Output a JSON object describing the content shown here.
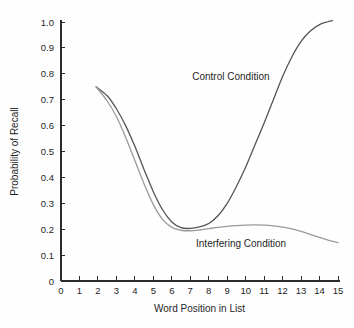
{
  "chart_data": {
    "type": "line",
    "title": "",
    "xlabel": "Word Position in List",
    "ylabel": "Probability of Recall",
    "xlim": [
      0,
      15
    ],
    "ylim": [
      0,
      1.0
    ],
    "grid": false,
    "legend_position": "inline-annotation",
    "x_ticks": [
      "0",
      "1",
      "2",
      "3",
      "4",
      "5",
      "6",
      "7",
      "8",
      "9",
      "10",
      "11",
      "12",
      "13",
      "14",
      "15"
    ],
    "y_ticks": [
      "0",
      "0.1",
      "0.2",
      "0.3",
      "0.4",
      "0.5",
      "0.6",
      "0.7",
      "0.8",
      "0.9",
      "1.0"
    ],
    "x_tick_values": [
      0,
      1,
      2,
      3,
      4,
      5,
      6,
      7,
      8,
      9,
      10,
      11,
      12,
      13,
      14,
      15
    ],
    "y_tick_values": [
      0,
      0.1,
      0.2,
      0.3,
      0.4,
      0.5,
      0.6,
      0.7,
      0.8,
      0.9,
      1.0
    ],
    "series": [
      {
        "name": "Control Condition",
        "color": "#555555",
        "label_x": 9.2,
        "label_y": 0.775,
        "x": [
          1.9,
          2.5,
          3.0,
          3.5,
          4.0,
          4.5,
          5.0,
          5.5,
          6.0,
          6.5,
          7.0,
          7.5,
          8.0,
          8.5,
          9.0,
          9.5,
          10.0,
          10.5,
          11.0,
          11.5,
          12.0,
          12.5,
          13.0,
          13.5,
          14.0,
          14.4,
          14.7
        ],
        "values": [
          0.75,
          0.715,
          0.665,
          0.6,
          0.52,
          0.43,
          0.345,
          0.275,
          0.228,
          0.206,
          0.203,
          0.209,
          0.222,
          0.252,
          0.3,
          0.365,
          0.44,
          0.525,
          0.61,
          0.7,
          0.79,
          0.865,
          0.925,
          0.965,
          0.99,
          1.0,
          1.005
        ]
      },
      {
        "name": "Interfering Condition",
        "color": "#9a9a9a",
        "label_x": 9.75,
        "label_y": 0.133,
        "x": [
          1.9,
          2.5,
          3.0,
          3.5,
          4.0,
          4.5,
          5.0,
          5.5,
          6.0,
          6.5,
          7.0,
          7.5,
          8.0,
          8.5,
          9.0,
          9.5,
          10.0,
          10.5,
          11.0,
          11.5,
          12.0,
          12.5,
          13.0,
          13.5,
          14.0,
          14.5,
          15.0
        ],
        "values": [
          0.75,
          0.695,
          0.635,
          0.555,
          0.465,
          0.375,
          0.295,
          0.238,
          0.207,
          0.196,
          0.194,
          0.197,
          0.202,
          0.207,
          0.211,
          0.214,
          0.216,
          0.217,
          0.216,
          0.213,
          0.208,
          0.201,
          0.192,
          0.18,
          0.168,
          0.157,
          0.148
        ]
      }
    ]
  },
  "layout": {
    "plot_left": 61,
    "plot_right": 338,
    "plot_top": 22,
    "plot_bottom": 281
  }
}
